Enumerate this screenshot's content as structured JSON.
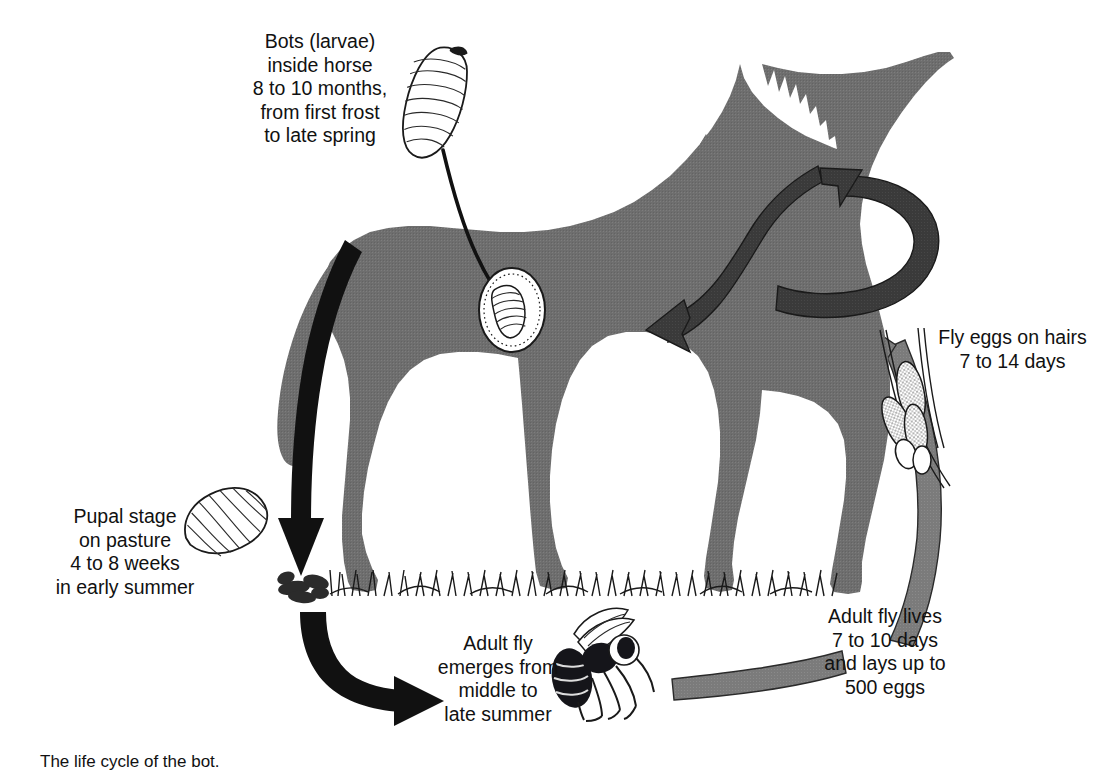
{
  "figure": {
    "caption": "The life cycle of the bot.",
    "colors": {
      "horse_gray": "#6e6e6e",
      "dark_arrow": "#3a3a3a",
      "mid_arrow": "#7b7b7b",
      "black_arrow": "#111111",
      "background": "#ffffff",
      "text": "#111111"
    }
  },
  "labels": {
    "bots_in_horse": "Bots (larvae)\ninside horse\n8 to 10 months,\nfrom first frost\nto late spring",
    "pupal_stage": "Pupal stage\non pasture\n4 to 8 weeks\nin early summer",
    "adult_fly_emerges": "Adult fly\nemerges from\nmiddle to\nlate summer",
    "adult_fly_lives": "Adult fly lives\n7 to 10 days\nand lays up to\n500 eggs",
    "fly_eggs": "Fly eggs on hairs\n7 to 14 days"
  },
  "stages": [
    {
      "id": "bots-larvae",
      "label": "Bots (larvae) inside horse",
      "duration": "8 to 10 months",
      "season": "from first frost to late spring",
      "icon": "bot-larva-icon"
    },
    {
      "id": "pupal-stage",
      "label": "Pupal stage on pasture",
      "duration": "4 to 8 weeks",
      "season": "in early summer",
      "icon": "pupa-icon"
    },
    {
      "id": "adult-fly-emerges",
      "label": "Adult fly emerges from",
      "duration": "middle to late summer",
      "season": "",
      "icon": "adult-fly-icon"
    },
    {
      "id": "adult-fly-lives",
      "label": "Adult fly lives and lays up to 500 eggs",
      "duration": "7 to 10 days",
      "season": "",
      "icon": "fly-band-icon"
    },
    {
      "id": "fly-eggs-on-hairs",
      "label": "Fly eggs on hairs",
      "duration": "7 to 14 days",
      "season": "",
      "icon": "eggs-on-hairs-icon"
    }
  ],
  "artwork": {
    "horse": "horse-silhouette",
    "grass": "grass-tufts",
    "stomach": "stomach-oval-with-larva",
    "larva_top": "bot-larva-illustration",
    "pupa_illustration": "pupa-illustration",
    "pupa_on_ground": "pupa-clump-on-ground",
    "fly": "adult-bot-fly-illustration",
    "eggs": "eggs-on-hairs-illustration"
  },
  "arrows": [
    {
      "id": "larva-to-stomach",
      "style": "thin-black-curve",
      "from": "bot-larva-illustration",
      "to": "stomach-oval"
    },
    {
      "id": "mouth-to-stomach",
      "style": "dark-thick-band",
      "from": "horse-mouth",
      "to": "stomach-oval"
    },
    {
      "id": "eggs-to-mouth",
      "style": "dark-thick-loop",
      "from": "eggs-on-hairs",
      "to": "horse-mouth"
    },
    {
      "id": "eggs-to-body",
      "style": "mid-gray-band",
      "from": "eggs-on-hairs",
      "to": "horse-body"
    },
    {
      "id": "rump-to-pupa",
      "style": "black-thick-curve",
      "from": "horse-rump",
      "to": "pupa-on-ground"
    },
    {
      "id": "pupa-to-fly",
      "style": "black-thick-curve",
      "from": "pupa-on-ground",
      "to": "adult-fly"
    },
    {
      "id": "fly-to-eggs",
      "style": "mid-gray-band",
      "from": "adult-fly",
      "to": "eggs-on-hairs"
    }
  ]
}
